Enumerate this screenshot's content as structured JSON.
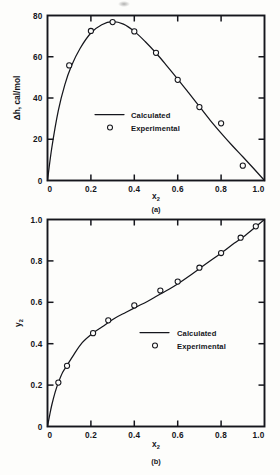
{
  "figure": {
    "panels": [
      {
        "id": "a",
        "caption": "(a)",
        "xlabel_base": "x",
        "xlabel_sub": "2",
        "ylabel": "Δh, cal/mol"
      },
      {
        "id": "b",
        "caption": "(b)",
        "xlabel_base": "x",
        "xlabel_sub": "2",
        "ylabel_base": "y",
        "ylabel_sub": "2"
      }
    ],
    "legend": {
      "calculated": "Calculated",
      "experimental": "Experimental"
    },
    "colors": {
      "ink": "#15161c",
      "paper": "#fdfdfb"
    }
  },
  "chart_data": [
    {
      "type": "line",
      "panel": "a",
      "title": "",
      "caption": "(a)",
      "xlabel": "x2",
      "ylabel": "Δh, cal/mol",
      "xlim": [
        0,
        1.0
      ],
      "ylim": [
        0,
        80
      ],
      "xticks": [
        0,
        0.2,
        0.4,
        0.6,
        0.8,
        1.0
      ],
      "xticklabels": [
        "0",
        "0.2",
        "0.4",
        "0.6",
        "0.8",
        "1.0"
      ],
      "yticks": [
        0,
        20,
        40,
        60,
        80
      ],
      "yticklabels": [
        "0",
        "20",
        "40",
        "60",
        "80"
      ],
      "grid": false,
      "legend_position": "center",
      "series": [
        {
          "name": "Calculated",
          "style": "line",
          "x": [
            0,
            0.02,
            0.05,
            0.08,
            0.11,
            0.15,
            0.2,
            0.25,
            0.3,
            0.35,
            0.4,
            0.45,
            0.5,
            0.55,
            0.6,
            0.65,
            0.7,
            0.75,
            0.8,
            0.85,
            0.9,
            0.95,
            1.0
          ],
          "y": [
            0,
            16,
            34,
            46.5,
            55.5,
            64,
            71.5,
            75.5,
            77,
            75.8,
            72.3,
            67.4,
            61.8,
            55.6,
            49.2,
            42.6,
            35.9,
            29.2,
            23.0,
            17.1,
            11.5,
            5.8,
            0
          ]
        },
        {
          "name": "Experimental",
          "style": "markers",
          "x": [
            0.1,
            0.2,
            0.3,
            0.4,
            0.5,
            0.6,
            0.7,
            0.8,
            0.9
          ],
          "y": [
            55.8,
            72.5,
            76.8,
            72.3,
            61.9,
            48.8,
            35.6,
            27.7,
            7.2
          ]
        }
      ]
    },
    {
      "type": "line",
      "panel": "b",
      "title": "",
      "caption": "(b)",
      "xlabel": "x2",
      "ylabel": "y2",
      "xlim": [
        0,
        1.0
      ],
      "ylim": [
        0,
        1.0
      ],
      "xticks": [
        0,
        0.2,
        0.4,
        0.6,
        0.8,
        1.0
      ],
      "xticklabels": [
        "0",
        "0.2",
        "0.4",
        "0.6",
        "0.8",
        "1.0"
      ],
      "yticks": [
        0,
        0.2,
        0.4,
        0.6,
        0.8,
        1.0
      ],
      "yticklabels": [
        "0",
        "0.2",
        "0.4",
        "0.6",
        "0.8",
        "1.0"
      ],
      "grid": false,
      "legend_position": "center-right",
      "series": [
        {
          "name": "Calculated",
          "style": "line",
          "x": [
            0,
            0.01,
            0.02,
            0.035,
            0.05,
            0.07,
            0.09,
            0.12,
            0.16,
            0.21,
            0.26,
            0.31,
            0.36,
            0.41,
            0.46,
            0.51,
            0.56,
            0.61,
            0.66,
            0.71,
            0.76,
            0.81,
            0.86,
            0.91,
            0.96,
            1.0
          ],
          "y": [
            0,
            0.055,
            0.105,
            0.165,
            0.212,
            0.262,
            0.295,
            0.345,
            0.405,
            0.452,
            0.487,
            0.523,
            0.551,
            0.578,
            0.604,
            0.634,
            0.663,
            0.696,
            0.732,
            0.77,
            0.808,
            0.845,
            0.885,
            0.922,
            0.965,
            1.0
          ]
        },
        {
          "name": "Experimental",
          "style": "markers",
          "x": [
            0.05,
            0.09,
            0.21,
            0.28,
            0.4,
            0.52,
            0.6,
            0.7,
            0.8,
            0.89,
            0.96
          ],
          "y": [
            0.212,
            0.293,
            0.451,
            0.513,
            0.585,
            0.657,
            0.7,
            0.767,
            0.838,
            0.912,
            0.967
          ]
        }
      ]
    }
  ]
}
